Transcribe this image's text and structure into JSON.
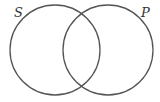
{
  "diagram": {
    "type": "venn",
    "sets": [
      {
        "label": "S",
        "cx": 55,
        "cy": 50,
        "r": 45
      },
      {
        "label": "P",
        "cx": 108,
        "cy": 50,
        "r": 45
      }
    ],
    "stroke_color": "#555555"
  }
}
